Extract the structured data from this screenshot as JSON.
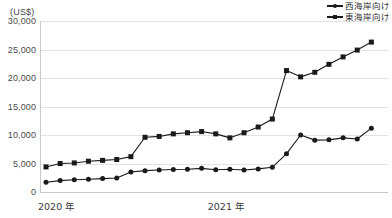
{
  "chart_data": {
    "type": "line",
    "title": "",
    "subtitle": "",
    "xlabel": "",
    "ylabel": "(US$)",
    "unit_label": "(US$)",
    "ylim": [
      0,
      30000
    ],
    "ytick_values": [
      30000,
      25000,
      20000,
      15000,
      10000,
      5000,
      0
    ],
    "ytick_labels": [
      "30,000",
      "25,000",
      "20,000",
      "15,000",
      "10,000",
      "5,000",
      "0"
    ],
    "grid": true,
    "legend_position": "top-right",
    "x_axis_labels": [
      {
        "label": "2020 年",
        "index": 0
      },
      {
        "label": "2021 年",
        "index": 12
      }
    ],
    "x": [
      1,
      2,
      3,
      4,
      5,
      6,
      7,
      8,
      9,
      10,
      11,
      12,
      13,
      14,
      15,
      16,
      17,
      18,
      19,
      20,
      21,
      22,
      23,
      24
    ],
    "series": [
      {
        "name": "西海岸向け",
        "marker": "circle",
        "color": "#1a1a1a",
        "values": [
          1700,
          2000,
          2150,
          2250,
          2350,
          2450,
          3500,
          3750,
          3850,
          3950,
          4000,
          4150,
          3900,
          4000,
          3850,
          4050,
          4350,
          6700,
          10000,
          9100,
          9150,
          9500,
          9300,
          11200
        ]
      },
      {
        "name": "東海岸向け",
        "marker": "square",
        "color": "#1a1a1a",
        "values": [
          4400,
          5000,
          5100,
          5400,
          5550,
          5700,
          6200,
          9600,
          9750,
          10200,
          10400,
          10600,
          10200,
          9500,
          10400,
          11400,
          12800,
          21300,
          20200,
          21000,
          22400,
          23700,
          24900,
          26300
        ]
      }
    ]
  }
}
